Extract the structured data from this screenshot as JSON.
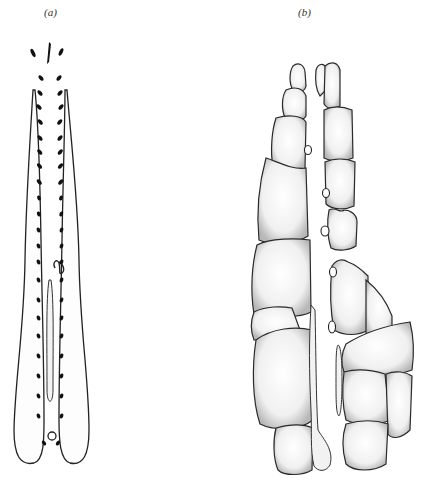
{
  "figure": {
    "panels": [
      {
        "id": "a",
        "label": "(a)",
        "description": "embryo dorsal view with paired somite dots"
      },
      {
        "id": "b",
        "label": "(b)",
        "description": "segmented tissue blocks with central elongated structures"
      }
    ]
  }
}
